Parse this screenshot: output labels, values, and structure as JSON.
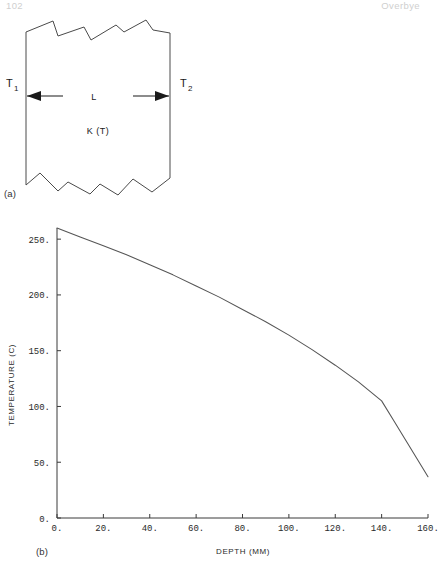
{
  "page": {
    "running_head_left": "102",
    "running_head_right": "Overbye"
  },
  "figure_a": {
    "caption": "(a)",
    "labels": {
      "left_temperature": "T",
      "left_temperature_sub": "1",
      "right_temperature": "T",
      "right_temperature_sub": "2",
      "thickness": "L",
      "conductivity": "K (T)"
    },
    "description": "slab-with-broken-edges"
  },
  "figure_b": {
    "caption": "(b)"
  },
  "chart_data": {
    "type": "line",
    "title": "",
    "xlabel": "DEPTH (MM)",
    "ylabel": "TEMPERATURE (C)",
    "xlim": [
      0,
      160
    ],
    "ylim": [
      0,
      260
    ],
    "xticks": [
      0,
      20,
      40,
      60,
      80,
      100,
      120,
      140,
      160
    ],
    "xtick_labels": [
      "0.",
      "20.",
      "40.",
      "60.",
      "80.",
      "100.",
      "120.",
      "140.",
      "160."
    ],
    "yticks": [
      0,
      50,
      100,
      150,
      200,
      250
    ],
    "ytick_labels": [
      "0.",
      "50.",
      "100.",
      "150.",
      "200.",
      "250."
    ],
    "grid": false,
    "legend": "none",
    "series": [
      {
        "name": "temperature-profile",
        "x": [
          0,
          10,
          20,
          30,
          40,
          50,
          60,
          70,
          80,
          90,
          100,
          110,
          120,
          130,
          140,
          145,
          150,
          155,
          160
        ],
        "y": [
          260,
          252,
          244,
          236,
          227,
          218,
          208,
          198,
          187,
          176,
          164,
          151,
          137,
          122,
          105,
          88,
          71,
          54,
          37
        ]
      }
    ]
  }
}
